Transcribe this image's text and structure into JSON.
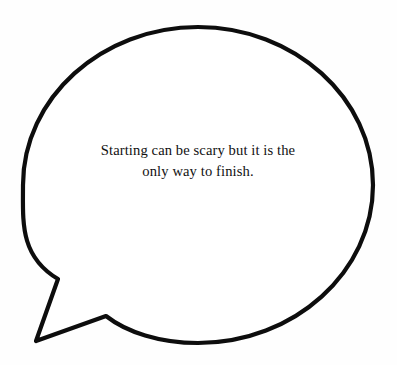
{
  "canvas": {
    "width": 397,
    "height": 365,
    "background_color": "#fefefe"
  },
  "bubble": {
    "name": "speech-bubble",
    "shape": "ellipse-with-tail",
    "stroke_color": "#0d0d0d",
    "fill_color": "#ffffff",
    "stroke_width": 4.2,
    "ellipse": {
      "center_x": 198,
      "center_y": 185,
      "radius_x": 175,
      "radius_y": 158
    },
    "tail": {
      "position": "bottom-left",
      "tip_x": 36,
      "tip_y": 341,
      "upper_join_x": 58,
      "upper_join_y": 279,
      "lower_join_x": 106,
      "lower_join_y": 316
    }
  },
  "quote": {
    "name": "bubble-quote",
    "text": "Starting can be scary but it is the only way to finish.",
    "lines": [
      "Starting can be scary but it is the",
      "only way to finish."
    ],
    "alignment": "center",
    "text_color": "#111111"
  }
}
